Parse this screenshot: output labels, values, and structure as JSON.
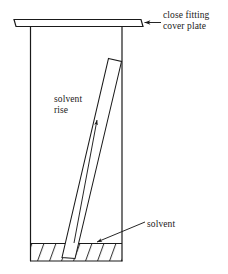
{
  "figure": {
    "background_color": "#ffffff",
    "stroke_color": "#1a1a1a"
  },
  "labels": {
    "cover_plate": {
      "line1": "close fitting",
      "line2": "cover plate"
    },
    "solvent_rise": {
      "line1": "solvent",
      "line2": "rise"
    },
    "solvent": {
      "line1": "solvent"
    }
  },
  "parts": {
    "cover_plate": "close-fitting-cover-plate",
    "tank_left_wall": "tank-left-wall",
    "tank_right_wall": "tank-right-wall",
    "tank_bottom": "tank-bottom",
    "tlc_plate": "tilted-tlc-plate",
    "solvent_pool": "hatched-solvent-pool",
    "solvent_front_line": "solvent-front-line"
  },
  "geometry": {
    "cover_plate_rect": {
      "x1": 14,
      "y1": 19,
      "x2": 141,
      "y2": 27
    },
    "tank_left_wall_x": 30,
    "tank_right_wall_x": 122,
    "tank_top_y": 27,
    "tank_bottom_y": 261,
    "solvent_level_y": 243,
    "tlc_plate_top": {
      "x": 109,
      "y": 58
    },
    "tlc_plate_bottom": {
      "x": 62,
      "y": 258
    }
  }
}
